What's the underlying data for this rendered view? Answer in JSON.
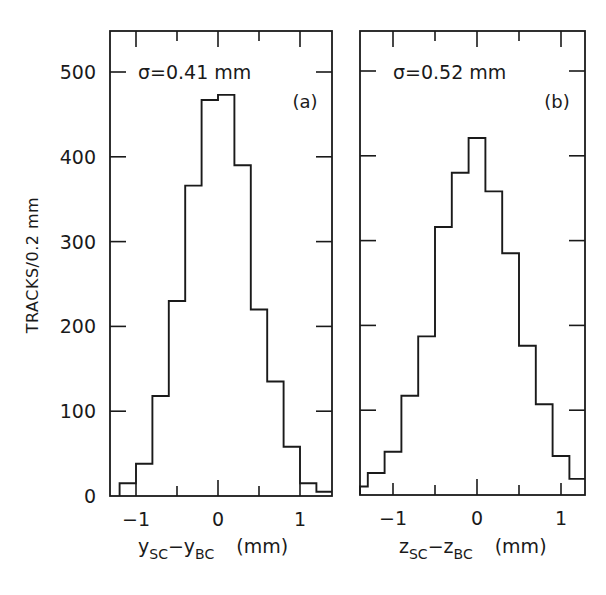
{
  "chart_data": [
    {
      "type": "bar",
      "subtype": "histogram",
      "panel": "(a)",
      "annotation": "σ=0.41 mm",
      "xlabel": "y_SC − y_BC (mm)",
      "xlabel_main": "y",
      "xlabel_sub1": "SC",
      "xlabel_mid": "−y",
      "xlabel_sub2": "BC",
      "xlabel_unit": "(mm)",
      "ylabel": "TRACKS/0.2 mm",
      "xlim": [
        -1.3,
        1.4
      ],
      "ylim": [
        0,
        540
      ],
      "xticks_major": [
        -1,
        0,
        1
      ],
      "xticks_minor": [
        -0.5,
        0.5
      ],
      "xtick_labels": [
        "−1",
        "0",
        "1"
      ],
      "yticks": [
        0,
        100,
        200,
        300,
        400,
        500
      ],
      "ytick_labels": [
        "0",
        "100",
        "200",
        "300",
        "400",
        "500"
      ],
      "bin_width": 0.2,
      "bin_edges": [
        -1.2,
        -1.0,
        -0.8,
        -0.6,
        -0.4,
        -0.2,
        0.0,
        0.2,
        0.4,
        0.6,
        0.8,
        1.0,
        1.2,
        1.4
      ],
      "values": [
        15,
        38,
        118,
        230,
        366,
        467,
        473,
        390,
        220,
        135,
        58,
        15,
        5
      ],
      "grid": false
    },
    {
      "type": "bar",
      "subtype": "histogram",
      "panel": "(b)",
      "annotation": "σ=0.52 mm",
      "xlabel": "z_SC − z_BC (mm)",
      "xlabel_main": "z",
      "xlabel_sub1": "SC",
      "xlabel_mid": "−z",
      "xlabel_sub2": "BC",
      "xlabel_unit": "(mm)",
      "ylabel": "TRACKS/0.2 mm",
      "xlim": [
        -1.4,
        1.3
      ],
      "ylim": [
        0,
        540
      ],
      "xticks_major": [
        -1,
        0,
        1
      ],
      "xticks_minor": [
        -0.5,
        0.5
      ],
      "xtick_labels": [
        "−1",
        "0",
        "1"
      ],
      "yticks": [
        0,
        100,
        200,
        300,
        400,
        500
      ],
      "bin_width": 0.2,
      "bin_edges": [
        -1.4,
        -1.3,
        -1.1,
        -0.9,
        -0.7,
        -0.5,
        -0.3,
        -0.1,
        0.1,
        0.3,
        0.5,
        0.7,
        0.9,
        1.1,
        1.3
      ],
      "values": [
        10,
        26,
        51,
        117,
        187,
        316,
        380,
        421,
        358,
        285,
        176,
        107,
        46,
        19
      ],
      "grid": false
    }
  ],
  "figure": {
    "ylabel": "TRACKS/0.2 mm",
    "caption_partial": "…Tracks …ched by the … …rdinates … the TPC…"
  }
}
